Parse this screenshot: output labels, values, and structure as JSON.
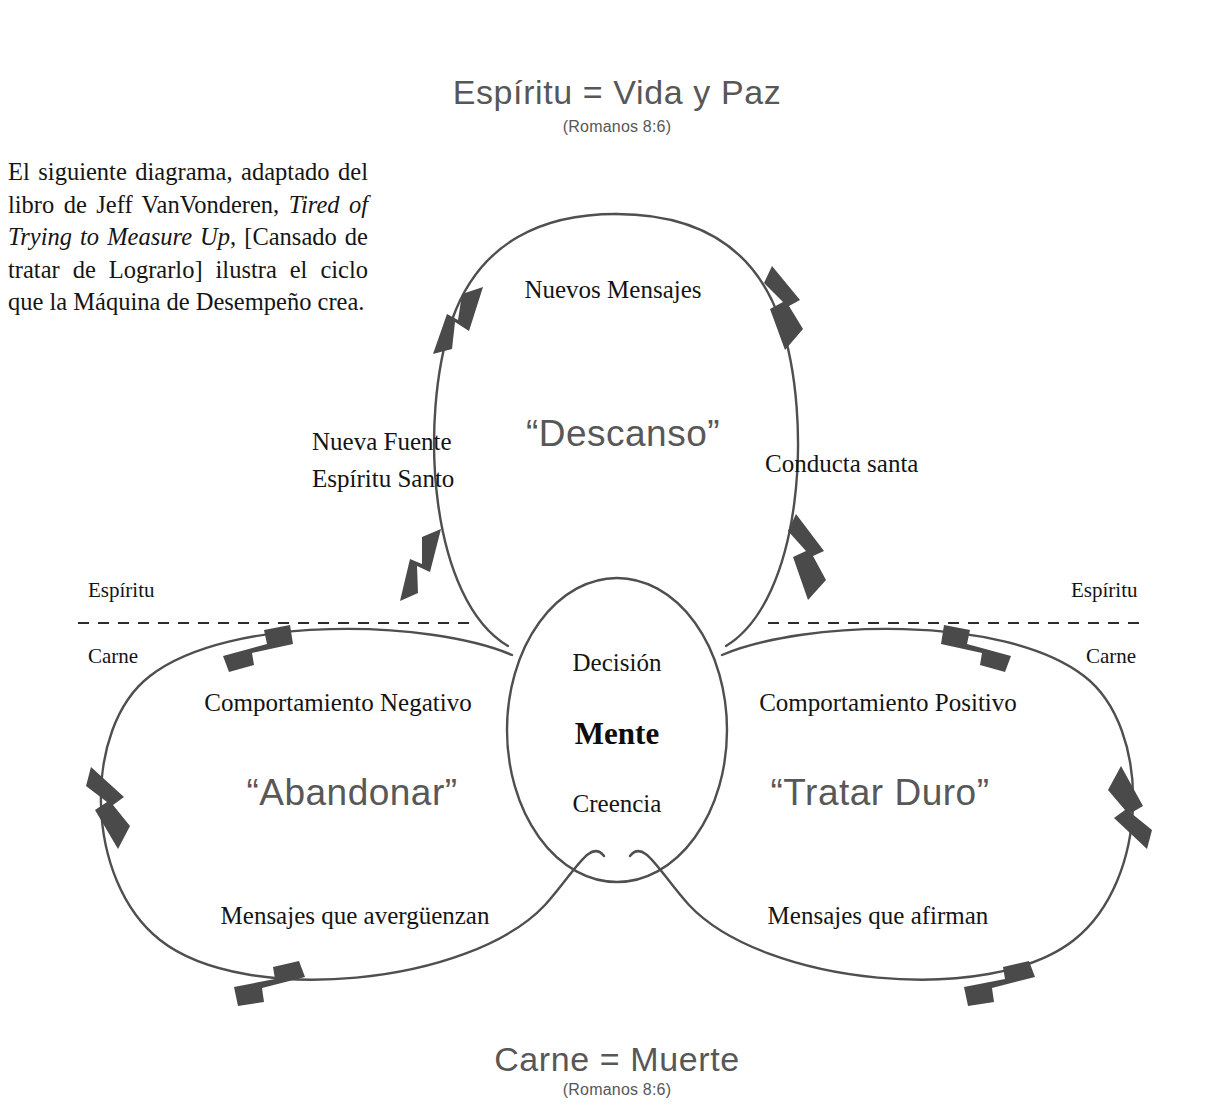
{
  "page": {
    "background": "#ffffff",
    "ink": "#1a1a1a",
    "arrow_color": "#4a4a4a",
    "curve_color": "#4f4f4f",
    "caption_color": "#575757"
  },
  "top_caption": {
    "title": "Espíritu = Vida y Paz",
    "reference": "(Romanos 8:6)"
  },
  "bottom_caption": {
    "title": "Carne = Muerte",
    "reference": "(Romanos 8:6)"
  },
  "intro": {
    "part1": "El siguiente diagrama, adaptado del libro de  Jeff VanVonderen, ",
    "book_title": "Tired of Trying to Measure Up",
    "part2": ", [Cansado de tratar de Lograrlo] ilustra el ciclo que la Máquina de Desempeño crea."
  },
  "center": {
    "top_label": "Decisión",
    "main_label": "Mente",
    "bottom_label": "Creencia"
  },
  "top_cycle": {
    "name": "“Descanso”",
    "label_top": "Nuevos Mensajes",
    "label_left_line1": "Nueva Fuente",
    "label_left_line2": "Espíritu Santo",
    "label_right": "Conducta santa"
  },
  "left_cycle": {
    "name": "“Abandonar”",
    "label_top": "Comportamiento Negativo",
    "label_bottom": "Mensajes que avergüenzan"
  },
  "right_cycle": {
    "name": "“Tratar Duro”",
    "label_top": "Comportamiento Positivo",
    "label_bottom": "Mensajes que afirman"
  },
  "divider_left": {
    "above": "Espíritu",
    "below": "Carne"
  },
  "divider_right": {
    "above": "Espíritu",
    "below": "Carne"
  }
}
